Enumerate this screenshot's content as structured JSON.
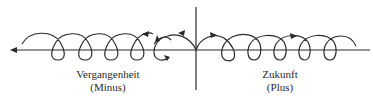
{
  "diagram": {
    "past": {
      "title": "Vergangenheit",
      "sign": "(Minus)"
    },
    "future": {
      "title": "Zukunft",
      "sign": "(Plus)"
    },
    "colors": {
      "stroke": "#2a2a2a",
      "background": "#ffffff"
    }
  }
}
